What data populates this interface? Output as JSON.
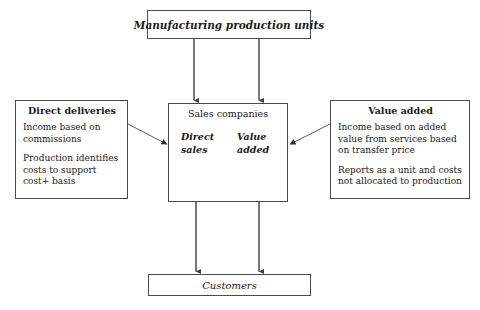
{
  "diagram": {
    "title_top": "Manufacturing production units",
    "center": {
      "header": "Sales companies",
      "column_left": "Direct sales",
      "column_right": "Value added"
    },
    "left_box": {
      "title": "Direct deliveries",
      "paragraph_1": "Income based on commissions",
      "paragraph_2": "Production identifies costs to support cost+ basis"
    },
    "right_box": {
      "title": "Value added",
      "paragraph_1": "Income based on added value from services based on transfer price",
      "paragraph_2": "Reports as a unit and costs not allocated to production"
    },
    "bottom": "Customers",
    "colors": {
      "border": "#4a4a4a",
      "text": "#1a1a1a",
      "arrow": "#4a4a4a",
      "background": "#ffffff"
    }
  }
}
